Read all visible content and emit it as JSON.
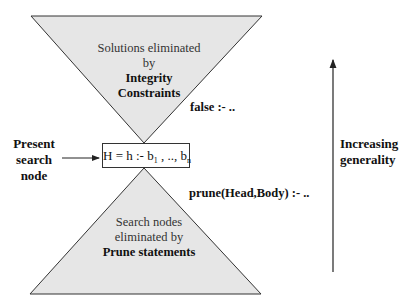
{
  "colors": {
    "triangle_fill": "#e6e6e6",
    "stroke": "#333333",
    "background": "#ffffff"
  },
  "top_triangle": {
    "line1": "Solutions eliminated",
    "line2": "by",
    "line3": "Integrity",
    "line4": "Constraints"
  },
  "bottom_triangle": {
    "line1": "Search nodes",
    "line2": "eliminated by",
    "line3": "Prune statements"
  },
  "rules": {
    "false_rule": "false :- ..",
    "prune_rule": "prune(Head,Body) :- .."
  },
  "search_node": {
    "label_line1": "Present",
    "label_line2": "search",
    "label_line3": "node",
    "formula_prefix": "H = h :- b",
    "formula_sub1": "1",
    "formula_mid": " , .., b",
    "formula_sub2": "n"
  },
  "generality": {
    "label_line1": "Increasing",
    "label_line2": "generality"
  }
}
